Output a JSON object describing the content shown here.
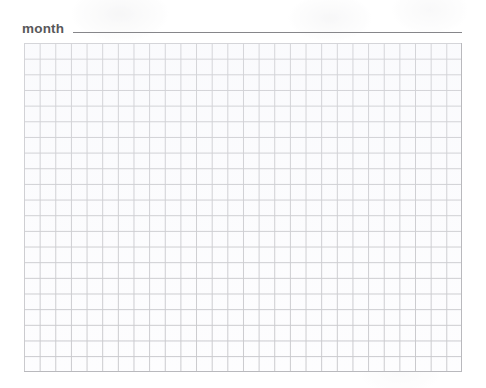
{
  "worksheet": {
    "name": "blank-graph-paper-worksheet",
    "background_color": "#ffffff"
  },
  "header": {
    "field_label": "month",
    "answer_line_value": "",
    "answer_line_placeholder": "",
    "label_color": "#58585a",
    "line_color": "#86868a"
  },
  "grid": {
    "columns": 28,
    "rows": 21,
    "cell_width_px": 15.6,
    "cell_height_px": 15.7,
    "line_color": "#b9b9bd",
    "cell_fill_color": "#fefeff",
    "left_px": 24,
    "top_px": 43,
    "width_px": 438,
    "height_px": 329
  }
}
